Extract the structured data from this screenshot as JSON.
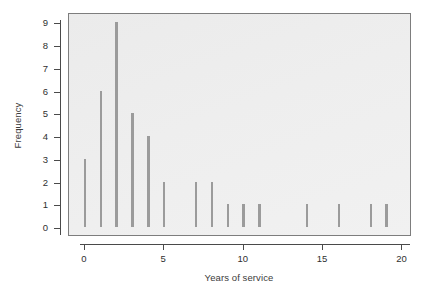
{
  "chart_data": {
    "type": "bar",
    "title": "",
    "subtitle": "",
    "xlabel": "Years of service",
    "ylabel": "Frequency",
    "categories": [
      0,
      1,
      2,
      3,
      4,
      5,
      6,
      7,
      8,
      9,
      10,
      11,
      12,
      13,
      14,
      15,
      16,
      17,
      18,
      19
    ],
    "values": [
      3,
      6,
      9,
      5,
      4,
      2,
      0,
      2,
      2,
      1,
      1,
      1,
      0,
      0,
      1,
      0,
      1,
      0,
      1,
      1
    ],
    "series": [
      {
        "name": "Frequency",
        "values": [
          3,
          6,
          9,
          5,
          4,
          2,
          0,
          2,
          2,
          1,
          1,
          1,
          0,
          0,
          1,
          0,
          1,
          0,
          1,
          1
        ]
      }
    ],
    "points": [
      {
        "x": 0,
        "y": 3
      },
      {
        "x": 1,
        "y": 6
      },
      {
        "x": 2,
        "y": 9
      },
      {
        "x": 3,
        "y": 5
      },
      {
        "x": 4,
        "y": 4
      },
      {
        "x": 5,
        "y": 2
      },
      {
        "x": 6,
        "y": 0
      },
      {
        "x": 7,
        "y": 2
      },
      {
        "x": 8,
        "y": 2
      },
      {
        "x": 9,
        "y": 1
      },
      {
        "x": 10,
        "y": 1
      },
      {
        "x": 11,
        "y": 1
      },
      {
        "x": 12,
        "y": 0
      },
      {
        "x": 13,
        "y": 0
      },
      {
        "x": 14,
        "y": 1
      },
      {
        "x": 15,
        "y": 0
      },
      {
        "x": 16,
        "y": 1
      },
      {
        "x": 17,
        "y": 0
      },
      {
        "x": 18,
        "y": 1
      },
      {
        "x": 19,
        "y": 1
      }
    ],
    "xlim": [
      -1.0,
      20.6
    ],
    "ylim": [
      -0.35,
      9.45
    ],
    "xticks": [
      0,
      5,
      10,
      15,
      20
    ],
    "xticklabels": [
      "0",
      "5",
      "10",
      "15",
      "20"
    ],
    "yticks": [
      0,
      1,
      2,
      3,
      4,
      5,
      6,
      7,
      8,
      9
    ],
    "yticklabels": [
      "0",
      "1",
      "2",
      "3",
      "4",
      "5",
      "6",
      "7",
      "8",
      "9"
    ],
    "grid": false,
    "legend": null,
    "legend_position": "none",
    "bar_color": "#9b9b9b",
    "panel_background": "#eeeeee",
    "panel_border_color": "#7d7d7d",
    "axis_color": "#4a4a4a",
    "text_color": "#2f2f2f",
    "figure_background": "#ffffff"
  }
}
